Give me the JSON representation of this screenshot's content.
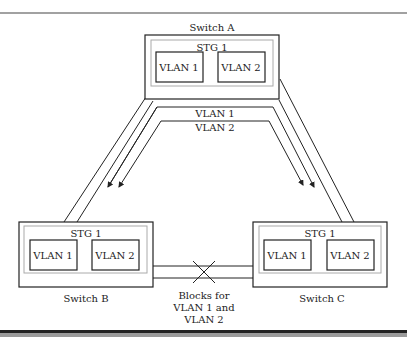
{
  "diagram": {
    "switches": [
      {
        "id": "A",
        "label": "Switch A",
        "stg": "STG 1",
        "vlans": [
          "VLAN 1",
          "VLAN 2"
        ]
      },
      {
        "id": "B",
        "label": "Switch B",
        "stg": "STG 1",
        "vlans": [
          "VLAN 1",
          "VLAN 2"
        ]
      },
      {
        "id": "C",
        "label": "Switch C",
        "stg": "STG 1",
        "vlans": [
          "VLAN 1",
          "VLAN 2"
        ]
      }
    ],
    "flows": [
      "VLAN 1",
      "VLAN 2"
    ],
    "block_label": [
      "Blocks for",
      "VLAN 1 and",
      "VLAN 2"
    ],
    "colors": {
      "line": "#222222",
      "inner_border": "#aaaaaa",
      "footer": "#9a9a9a"
    }
  }
}
